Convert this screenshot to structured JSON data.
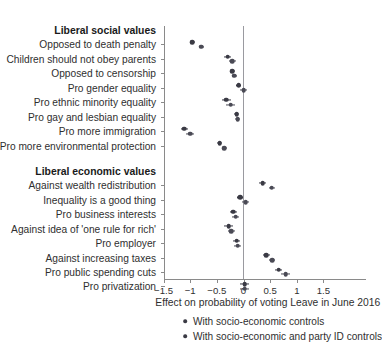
{
  "figure": {
    "xlabel": "Effect on probability of voting Leave in June 2016",
    "group_social": "Liberal social values",
    "group_economic": "Liberal economic values"
  },
  "legend": {
    "items": [
      {
        "label": "With socio-economic controls",
        "marker": "dot"
      },
      {
        "label": "With socio-economic and party ID controls",
        "marker": "dot"
      }
    ]
  },
  "chart_data": {
    "type": "scatter",
    "title": "",
    "xlabel": "Effect on probability of voting Leave in June 2016",
    "ylabel": "",
    "xlim": [
      -1.75,
      1.75
    ],
    "xticks": [
      -1.5,
      -1,
      -0.5,
      0,
      0.5,
      1,
      1.5
    ],
    "xticklabels": [
      "−1.5",
      "−1",
      "−0.5",
      "0",
      "0.5",
      "1",
      "1.5"
    ],
    "grid": false,
    "reference_line": 0,
    "legend_position": "below",
    "series": [
      {
        "name": "With socio-economic controls",
        "color": "#3a3a44"
      },
      {
        "name": "With socio-economic and party ID controls",
        "color": "#4a4a55"
      }
    ],
    "groups": [
      {
        "name": "Liberal social values",
        "categories": [
          "Opposed to death penalty",
          "Children should not obey parents",
          "Opposed to censorship",
          "Pro gender equality",
          "Pro ethnic minority equality",
          "Pro gay and lesbian equality",
          "Pro more immigration",
          "Pro more environmental protection"
        ],
        "estimates": {
          "With socio-economic controls": [
            -0.96,
            -0.3,
            -0.21,
            -0.09,
            -0.32,
            -0.13,
            -1.11,
            -0.45
          ],
          "With socio-economic and party ID controls": [
            -0.79,
            -0.21,
            -0.17,
            0.0,
            -0.24,
            -0.11,
            -1.0,
            -0.36
          ]
        },
        "ci_low": {
          "With socio-economic controls": [
            -1.01,
            -0.36,
            -0.26,
            -0.14,
            -0.4,
            -0.18,
            -1.18,
            -0.5
          ],
          "With socio-economic and party ID controls": [
            -0.84,
            -0.28,
            -0.22,
            -0.06,
            -0.32,
            -0.16,
            -1.07,
            -0.41
          ]
        },
        "ci_high": {
          "With socio-economic controls": [
            -0.91,
            -0.24,
            -0.16,
            -0.04,
            -0.24,
            -0.08,
            -1.04,
            -0.4
          ],
          "With socio-economic and party ID controls": [
            -0.74,
            -0.14,
            -0.12,
            0.06,
            -0.16,
            -0.06,
            -0.93,
            -0.31
          ]
        }
      },
      {
        "name": "Liberal economic values",
        "categories": [
          "Against wealth redistribution",
          "Inequality is a good thing",
          "Pro business interests",
          "Against idea of 'one rule for rich'",
          "Pro employer",
          "Against increasing taxes",
          "Pro public spending cuts",
          "Pro privatization"
        ],
        "estimates": {
          "With socio-economic controls": [
            0.36,
            -0.06,
            -0.19,
            -0.28,
            -0.13,
            0.43,
            0.66,
            0.02
          ],
          "With socio-economic and party ID controls": [
            0.53,
            0.04,
            -0.15,
            -0.23,
            -0.11,
            0.54,
            0.79,
            0.02
          ]
        },
        "ci_low": {
          "With socio-economic controls": [
            0.3,
            -0.12,
            -0.25,
            -0.36,
            -0.19,
            0.37,
            0.59,
            -0.07
          ],
          "With socio-economic and party ID controls": [
            0.47,
            -0.02,
            -0.21,
            -0.3,
            -0.17,
            0.48,
            0.71,
            -0.07
          ]
        },
        "ci_high": {
          "With socio-economic controls": [
            0.42,
            0.0,
            -0.13,
            -0.2,
            -0.07,
            0.49,
            0.73,
            0.11
          ],
          "With socio-economic and party ID controls": [
            0.59,
            0.1,
            -0.09,
            -0.16,
            -0.05,
            0.6,
            0.87,
            0.11
          ]
        }
      }
    ]
  }
}
